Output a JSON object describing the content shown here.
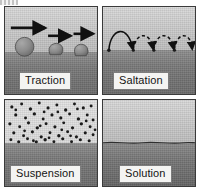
{
  "figure": {
    "panel_count": 4,
    "colors": {
      "sky": "#d4d4d4",
      "ground": "#7a7a7a",
      "ink": "#141414",
      "label_bg": "#f4f4f2",
      "label_border": "#7d7d7d",
      "panel_border": "#3a3a3a"
    }
  },
  "panels": [
    {
      "id": "traction",
      "label": "Traction",
      "position": "top-left",
      "description": "Large grains rolling and sliding along the bed, each with a horizontal motion arrow above it",
      "grains": [
        {
          "cx": 20,
          "cy": 40,
          "r": 9.5
        },
        {
          "cx": 52,
          "cy": 43,
          "r": 7.0
        },
        {
          "cx": 78,
          "cy": 43,
          "r": 7.0
        }
      ],
      "arrows": [
        {
          "x1": 6,
          "x2": 44,
          "y": 22
        },
        {
          "x1": 43,
          "x2": 70,
          "y": 30
        },
        {
          "x1": 70,
          "x2": 93,
          "y": 28
        }
      ],
      "bed_top_pct": 52
    },
    {
      "id": "saltation",
      "label": "Saltation",
      "position": "top-right",
      "description": "Grains bouncing in a series of ballistic hops along the bed; first hop solid, following hops dashed",
      "hops": 4,
      "first_hop_solid": true,
      "bed_top_pct": 50
    },
    {
      "id": "suspension",
      "label": "Suspension",
      "position": "bottom-left",
      "description": "Fine particles dispersed throughout the water column above the bed",
      "particle_count": 62,
      "bed_top_pct": 50
    },
    {
      "id": "solution",
      "label": "Solution",
      "position": "bottom-right",
      "description": "Dissolved load carried invisibly in the water; no visible particles above the bed",
      "particle_count": 0,
      "bed_top_pct": 50
    }
  ]
}
